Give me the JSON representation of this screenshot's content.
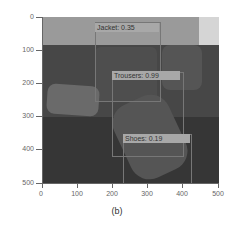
{
  "figure": {
    "caption": "(b)",
    "y_ticks": [
      "0",
      "100",
      "200",
      "300",
      "400",
      "500"
    ],
    "x_ticks": [
      "0",
      "100",
      "200",
      "300",
      "400",
      "500"
    ]
  },
  "detections": [
    {
      "label": "Jacket: 0.35"
    },
    {
      "label": "Trousers: 0.99"
    },
    {
      "label": "Shoes: 0.19"
    }
  ]
}
